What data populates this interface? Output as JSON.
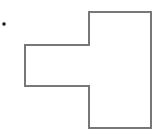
{
  "diagram": {
    "width": 157,
    "height": 131,
    "background": "#ffffff",
    "bullet": {
      "x": 4,
      "y": 24,
      "size": 3,
      "color": "#111111"
    },
    "shape": {
      "type": "polygon",
      "description": "rectilinear T-like polygon: tall rectangle on right with a rectangular tab protruding to the left",
      "stroke": "#777777",
      "stroke_width": 2,
      "fill": "none",
      "points": [
        [
          89,
          12
        ],
        [
          151,
          12
        ],
        [
          151,
          128
        ],
        [
          89,
          128
        ],
        [
          89,
          86
        ],
        [
          25,
          86
        ],
        [
          25,
          45
        ],
        [
          89,
          45
        ]
      ]
    }
  }
}
